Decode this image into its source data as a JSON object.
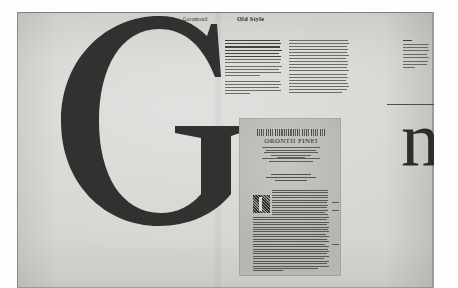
{
  "document": {
    "kind": "book-spread-photograph",
    "subject": "Garamond Old Style typeface specimen",
    "paper_color": "#d5d6d2",
    "ink_color": "#33312f"
  },
  "running_heads": {
    "left": "Garamond",
    "right": "Old Style"
  },
  "display_glyphs": {
    "capital": "G",
    "lowercase": "n"
  },
  "columns": [
    {
      "id": "column-one",
      "lines": 18,
      "emphasis_lines": [
        0,
        1,
        2,
        3,
        4,
        5
      ],
      "paragraph_breaks": [
        11,
        12
      ]
    },
    {
      "id": "column-two",
      "lines": 18,
      "emphasis_lines": [],
      "paragraph_breaks": []
    },
    {
      "id": "column-three",
      "lines": 9,
      "emphasis_lines": [
        0
      ],
      "paragraph_breaks": []
    }
  ],
  "plate": {
    "caption_title": "ORONTII FINEI",
    "title_rule_lines": 5,
    "subtitle_lines": 4,
    "imprint_lines": 3,
    "body_lines": 34,
    "initial_letter": "I",
    "has_woodcut_headpiece": true,
    "marginal_notes": 3
  },
  "rules": {
    "n_rule_color": "#4e4d4b"
  }
}
